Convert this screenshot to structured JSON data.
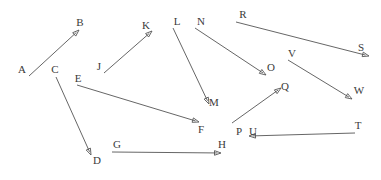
{
  "figure": {
    "type": "directed-graph",
    "width": 381,
    "height": 180,
    "background_color": "#ffffff",
    "edge_color": "#555555",
    "label_color": "#3a3a3a"
  },
  "nodes": [
    {
      "id": "A",
      "label": "A",
      "x": 22,
      "y": 69
    },
    {
      "id": "B",
      "label": "B",
      "x": 80,
      "y": 22
    },
    {
      "id": "C",
      "label": "C",
      "x": 55,
      "y": 69
    },
    {
      "id": "D",
      "label": "D",
      "x": 97,
      "y": 160
    },
    {
      "id": "E",
      "label": "E",
      "x": 78,
      "y": 78
    },
    {
      "id": "F",
      "label": "F",
      "x": 201,
      "y": 129
    },
    {
      "id": "G",
      "label": "G",
      "x": 117,
      "y": 144
    },
    {
      "id": "H",
      "label": "H",
      "x": 222,
      "y": 144
    },
    {
      "id": "J",
      "label": "J",
      "x": 99,
      "y": 66
    },
    {
      "id": "K",
      "label": "K",
      "x": 146,
      "y": 25
    },
    {
      "id": "L",
      "label": "L",
      "x": 177,
      "y": 21
    },
    {
      "id": "M",
      "label": "M",
      "x": 214,
      "y": 102
    },
    {
      "id": "N",
      "label": "N",
      "x": 201,
      "y": 21
    },
    {
      "id": "O",
      "label": "O",
      "x": 271,
      "y": 67
    },
    {
      "id": "P",
      "label": "P",
      "x": 239,
      "y": 131
    },
    {
      "id": "Q",
      "label": "Q",
      "x": 285,
      "y": 86
    },
    {
      "id": "R",
      "label": "R",
      "x": 243,
      "y": 14
    },
    {
      "id": "S",
      "label": "S",
      "x": 361,
      "y": 47
    },
    {
      "id": "T",
      "label": "T",
      "x": 358,
      "y": 125
    },
    {
      "id": "U",
      "label": "U",
      "x": 253,
      "y": 131
    },
    {
      "id": "V",
      "label": "V",
      "x": 292,
      "y": 53
    },
    {
      "id": "W",
      "label": "W",
      "x": 359,
      "y": 90
    }
  ],
  "edges": [
    {
      "id": "edge-a-b",
      "from": "A",
      "to": "B",
      "x1": 29,
      "y1": 76,
      "x2": 79,
      "y2": 30,
      "arrow": true
    },
    {
      "id": "edge-c-d",
      "from": "C",
      "to": "D",
      "x1": 56,
      "y1": 77,
      "x2": 91,
      "y2": 155,
      "arrow": true
    },
    {
      "id": "edge-e-f",
      "from": "E",
      "to": "F",
      "x1": 77,
      "y1": 85,
      "x2": 199,
      "y2": 122,
      "arrow": true
    },
    {
      "id": "edge-g-h",
      "from": "G",
      "to": "H",
      "x1": 112,
      "y1": 152,
      "x2": 221,
      "y2": 153,
      "arrow": true
    },
    {
      "id": "edge-j-k",
      "from": "J",
      "to": "K",
      "x1": 104,
      "y1": 73,
      "x2": 152,
      "y2": 31,
      "arrow": true
    },
    {
      "id": "edge-l-m",
      "from": "L",
      "to": "M",
      "x1": 173,
      "y1": 28,
      "x2": 209,
      "y2": 104,
      "arrow": true
    },
    {
      "id": "edge-n-o",
      "from": "N",
      "to": "O",
      "x1": 195,
      "y1": 28,
      "x2": 266,
      "y2": 75,
      "arrow": true
    },
    {
      "id": "edge-p-q",
      "from": "P",
      "to": "Q",
      "x1": 232,
      "y1": 123,
      "x2": 281,
      "y2": 88,
      "arrow": true
    },
    {
      "id": "edge-r-s",
      "from": "R",
      "to": "S",
      "x1": 236,
      "y1": 22,
      "x2": 369,
      "y2": 56,
      "arrow": true
    },
    {
      "id": "edge-v-w",
      "from": "V",
      "to": "W",
      "x1": 288,
      "y1": 60,
      "x2": 352,
      "y2": 99,
      "arrow": true
    },
    {
      "id": "edge-t-u",
      "from": "T",
      "to": "U",
      "x1": 355,
      "y1": 133,
      "x2": 249,
      "y2": 136,
      "arrow": true
    }
  ]
}
